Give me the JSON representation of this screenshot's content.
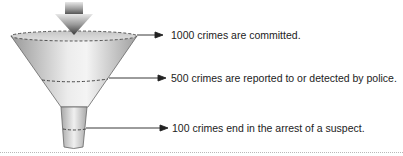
{
  "diagram": {
    "type": "funnel",
    "stages": [
      {
        "count": 1000,
        "label": "1000 crimes are committed."
      },
      {
        "count": 500,
        "label": "500 crimes are reported to or detected by police."
      },
      {
        "count": 100,
        "label": "100 crimes end in the arrest of a suspect."
      }
    ],
    "colors": {
      "funnel_light": "#f2f2f2",
      "funnel_mid": "#c8c8c8",
      "funnel_dark": "#8c8c8c",
      "outline": "#555555",
      "arrow": "#222222",
      "text": "#222222",
      "rule": "#b8b8b8"
    }
  }
}
